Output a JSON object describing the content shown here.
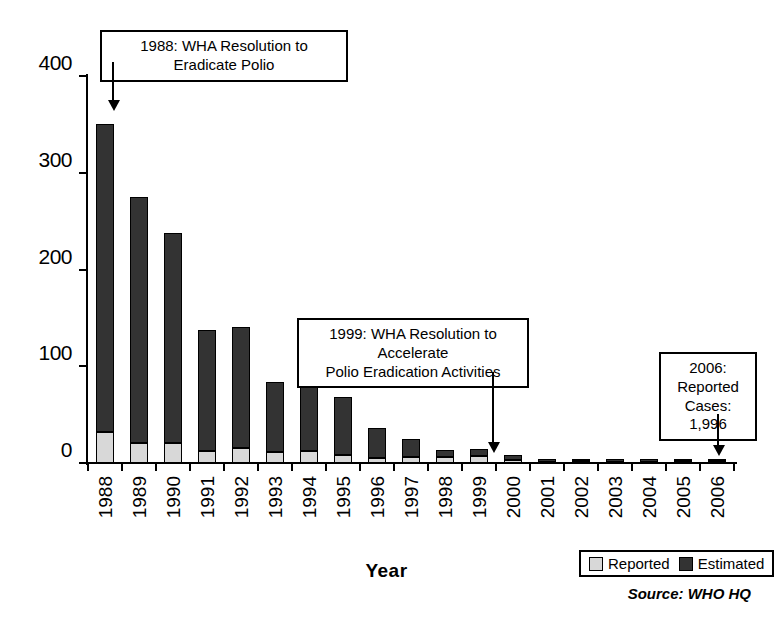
{
  "chart_data": {
    "type": "bar",
    "subtype": "stacked",
    "title": "",
    "xlabel": "Year",
    "ylabel": "Number (thousands)",
    "ylim": [
      0,
      400
    ],
    "yticks": [
      0,
      100,
      200,
      300,
      400
    ],
    "ytick_labels": [
      "0",
      "100",
      "200",
      "300",
      "400"
    ],
    "grid": false,
    "legend_position": "bottom-right",
    "categories": [
      "1988",
      "1989",
      "1990",
      "1991",
      "1992",
      "1993",
      "1994",
      "1995",
      "1996",
      "1997",
      "1998",
      "1999",
      "2000",
      "2001",
      "2002",
      "2003",
      "2004",
      "2005",
      "2006"
    ],
    "series": [
      {
        "name": "Reported",
        "color": "#d8d8d8",
        "values": [
          32,
          21,
          21,
          12,
          16,
          11,
          12,
          8,
          5,
          6,
          6,
          7,
          3,
          1,
          2,
          1,
          1,
          2,
          2
        ]
      },
      {
        "name": "Estimated",
        "color": "#333333",
        "values": [
          318,
          254,
          217,
          126,
          125,
          73,
          67,
          60,
          31,
          19,
          7,
          7,
          5,
          3,
          2,
          3,
          3,
          2,
          2
        ]
      }
    ],
    "totals": [
      350,
      275,
      238,
      138,
      141,
      84,
      79,
      68,
      36,
      25,
      13,
      14,
      8,
      4,
      4,
      4,
      4,
      4,
      4
    ],
    "annotations": [
      {
        "id": "annot-1988",
        "text": "1988: WHA Resolution to Eradicate Polio",
        "points_to": "1988"
      },
      {
        "id": "annot-1999",
        "text": "1999: WHA Resolution to Accelerate\nPolio Eradication Activities",
        "points_to": "1999"
      },
      {
        "id": "annot-2006",
        "text": "2006:\nReported\nCases: 1,996",
        "points_to": "2006"
      }
    ]
  },
  "legend": {
    "items": [
      {
        "label": "Reported",
        "color": "#d8d8d8"
      },
      {
        "label": "Estimated",
        "color": "#333333"
      }
    ]
  },
  "source": {
    "text": "Source: WHO HQ"
  },
  "colors": {
    "reported": "#d8d8d8",
    "estimated": "#333333",
    "axis": "#000000",
    "background": "#ffffff"
  }
}
